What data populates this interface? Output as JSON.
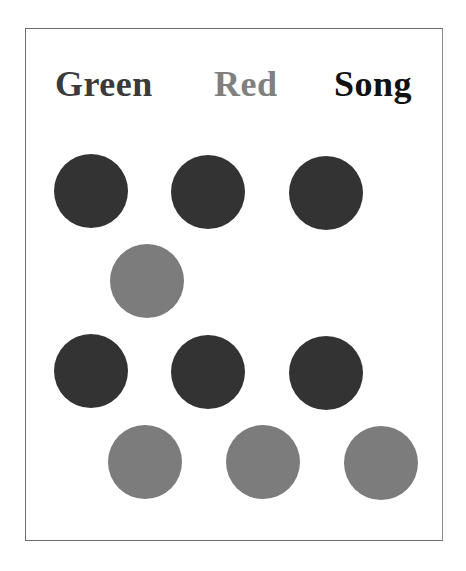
{
  "title_words": [
    {
      "text": "Green",
      "color": "#3a3a3a"
    },
    {
      "text": "Red",
      "color": "#808080"
    },
    {
      "text": "Song",
      "color": "#111111"
    }
  ],
  "colors": {
    "dark_circle": "#333333",
    "gray_circle": "#7c7c7c",
    "frame_border": "#6e6e6e"
  },
  "circles": [
    {
      "row": 1,
      "col": 1,
      "shade": "dark"
    },
    {
      "row": 1,
      "col": 2,
      "shade": "dark"
    },
    {
      "row": 1,
      "col": 3,
      "shade": "dark"
    },
    {
      "row": 2,
      "col": 1,
      "shade": "gray"
    },
    {
      "row": 3,
      "col": 1,
      "shade": "dark"
    },
    {
      "row": 3,
      "col": 2,
      "shade": "dark"
    },
    {
      "row": 3,
      "col": 3,
      "shade": "dark"
    },
    {
      "row": 4,
      "col": 1,
      "shade": "gray"
    },
    {
      "row": 4,
      "col": 2,
      "shade": "gray"
    },
    {
      "row": 4,
      "col": 3,
      "shade": "gray"
    }
  ]
}
